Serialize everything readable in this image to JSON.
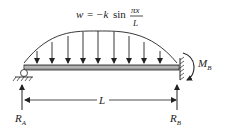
{
  "diagram": {
    "load_formula": {
      "lhs": "w",
      "eq": "=",
      "coef": "−k",
      "func": "sin",
      "numerator": "πx",
      "denominator": "L"
    },
    "labels": {
      "reaction_a": "R",
      "reaction_a_sub": "A",
      "reaction_b": "R",
      "reaction_b_sub": "B",
      "moment_b": "M",
      "moment_b_sub": "B",
      "span": "L"
    },
    "supports": {
      "left": "pin-roller support",
      "right": "fixed wall"
    },
    "load_arrow_count": 9,
    "colors": {
      "line": "#222222",
      "beam_fill": "#9a9a9a",
      "background": "#ffffff"
    }
  }
}
